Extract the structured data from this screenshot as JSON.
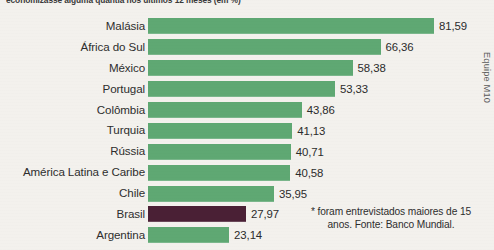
{
  "chart_data": {
    "type": "bar",
    "orientation": "horizontal",
    "title": "economizasse alguma quantia nos últimos 12 meses (em %)",
    "xlabel": "",
    "ylabel": "",
    "xlim": [
      0,
      100
    ],
    "grid": false,
    "legend": "none",
    "value_format": "comma-decimal",
    "categories": [
      "Malásia",
      "África do Sul",
      "México",
      "Portugal",
      "Colômbia",
      "Turquia",
      "Rússia",
      "América Latina e Caribe",
      "Chile",
      "Brasil",
      "Argentina"
    ],
    "values": [
      81.59,
      66.36,
      58.38,
      53.33,
      43.86,
      41.13,
      40.71,
      40.58,
      35.95,
      27.97,
      23.14
    ],
    "value_labels": [
      "81,59",
      "66,36",
      "58,38",
      "53,33",
      "43,86",
      "41,13",
      "40,71",
      "40,58",
      "35,95",
      "27,97",
      "23,14"
    ],
    "highlight_category": "Brasil",
    "colors": {
      "bar": "#5fa873",
      "bar_highlight": "#4a2035",
      "background": "#f3f1ed",
      "text": "#2b2b2b"
    }
  },
  "rows": [
    {
      "label": "Malásia",
      "value": 81.59,
      "value_label": "81,59",
      "highlight": false
    },
    {
      "label": "África do Sul",
      "value": 66.36,
      "value_label": "66,36",
      "highlight": false
    },
    {
      "label": "México",
      "value": 58.38,
      "value_label": "58,38",
      "highlight": false
    },
    {
      "label": "Portugal",
      "value": 53.33,
      "value_label": "53,33",
      "highlight": false
    },
    {
      "label": "Colômbia",
      "value": 43.86,
      "value_label": "43,86",
      "highlight": false
    },
    {
      "label": "Turquia",
      "value": 41.13,
      "value_label": "41,13",
      "highlight": false
    },
    {
      "label": "Rússia",
      "value": 40.71,
      "value_label": "40,71",
      "highlight": false
    },
    {
      "label": "América Latina e Caribe",
      "value": 40.58,
      "value_label": "40,58",
      "highlight": false
    },
    {
      "label": "Chile",
      "value": 35.95,
      "value_label": "35,95",
      "highlight": false
    },
    {
      "label": "Brasil",
      "value": 27.97,
      "value_label": "27,97",
      "highlight": true
    },
    {
      "label": "Argentina",
      "value": 23.14,
      "value_label": "23,14",
      "highlight": false
    }
  ],
  "credit": "Equipe M10",
  "footnote": "* foram entrevistados maiores de 15 anos. Fonte: Banco Mundial."
}
